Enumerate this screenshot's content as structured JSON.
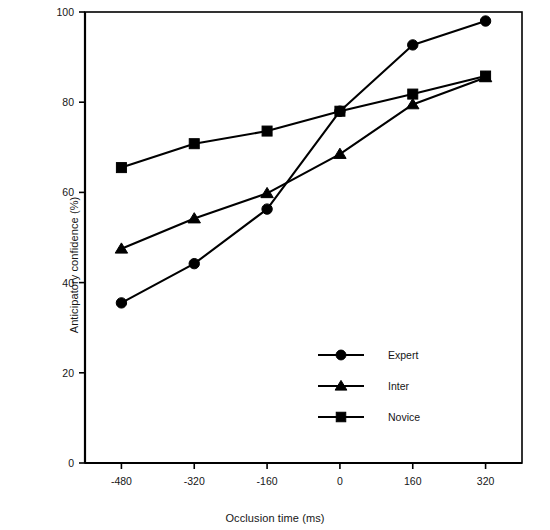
{
  "chart_data": {
    "type": "line",
    "title": "",
    "subtitle": "",
    "xlabel": "Occlusion time (ms)",
    "ylabel": "Anticipatory confidence (%)",
    "x": [
      -480,
      -320,
      -160,
      0,
      160,
      320
    ],
    "xtick_labels": [
      "-480",
      "-320",
      "-160",
      "0",
      "160",
      "320"
    ],
    "ytick_labels": [
      "0",
      "20",
      "40",
      "60",
      "80",
      "100"
    ],
    "yticks": [
      0,
      20,
      40,
      60,
      80,
      100
    ],
    "xlim": [
      -560,
      400
    ],
    "ylim": [
      0,
      100
    ],
    "grid": false,
    "legend_position": "inside-lower-center",
    "series": [
      {
        "name": "Expert",
        "marker": "circle",
        "color": "#000000",
        "values": [
          35.5,
          44.2,
          56.3,
          78.0,
          92.7,
          98.0
        ]
      },
      {
        "name": "Inter",
        "marker": "triangle",
        "color": "#000000",
        "values": [
          47.5,
          54.2,
          59.8,
          68.5,
          79.5,
          85.5
        ]
      },
      {
        "name": "Novice",
        "marker": "square",
        "color": "#000000",
        "values": [
          65.5,
          70.8,
          73.6,
          78.0,
          81.8,
          85.8
        ]
      }
    ]
  },
  "axes": {
    "y_axis_label": "Anticipatory confidence (%)",
    "x_axis_label": "Occlusion time (ms)"
  },
  "legend": {
    "entries": [
      {
        "label": "Expert",
        "marker": "circle"
      },
      {
        "label": "Inter",
        "marker": "triangle"
      },
      {
        "label": "Novice",
        "marker": "square"
      }
    ]
  },
  "colors": {
    "ink": "#000000",
    "background": "#ffffff",
    "text": "#161616"
  }
}
